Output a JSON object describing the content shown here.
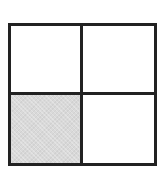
{
  "diagram": {
    "type": "2x2 grid",
    "rows": 2,
    "columns": 2,
    "border_color": "#222222",
    "shade_color": "#d9d9d9",
    "cells": [
      {
        "row": 0,
        "col": 0,
        "shaded": false
      },
      {
        "row": 0,
        "col": 1,
        "shaded": false
      },
      {
        "row": 1,
        "col": 0,
        "shaded": true
      },
      {
        "row": 1,
        "col": 1,
        "shaded": false
      }
    ]
  }
}
